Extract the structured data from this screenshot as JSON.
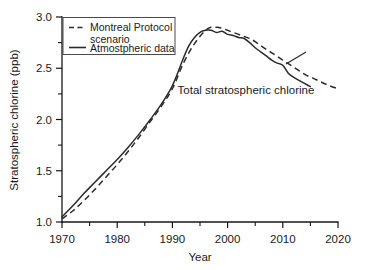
{
  "chart_data": {
    "type": "line",
    "title": "",
    "xlabel": "Year",
    "ylabel": "Stratospheric chlorine (ppb)",
    "xlim": [
      1970,
      2020
    ],
    "ylim": [
      1.0,
      3.0
    ],
    "xticks": [
      1970,
      1980,
      1990,
      2000,
      2010,
      2020
    ],
    "xtick_labels": [
      "1970",
      "1980",
      "1990",
      "2000",
      "2010",
      "2020"
    ],
    "yticks": [
      1.0,
      1.5,
      2.0,
      2.5,
      3.0
    ],
    "ytick_labels": [
      "1.0",
      "1.5",
      "2.0",
      "2.5",
      "3.0"
    ],
    "x_minor_ticks": [
      1975,
      1985,
      1995,
      2005,
      2015
    ],
    "y_minor_ticks": [
      1.25,
      1.75,
      2.25,
      2.75
    ],
    "grid": false,
    "legend_position": "top-left",
    "annotations": [
      {
        "text": "Total stratospheric chlorine",
        "x": 2000,
        "y": 2.38
      }
    ],
    "series": [
      {
        "name": "Montreal Protocol scenario",
        "style": "dashed",
        "color": "#2b2b2b",
        "x": [
          1970,
          1972,
          1974,
          1976,
          1978,
          1980,
          1982,
          1984,
          1986,
          1988,
          1990,
          1992,
          1994,
          1996,
          1997,
          1998,
          1999,
          2000,
          2001,
          2002,
          2003,
          2004,
          2005,
          2006,
          2008,
          2010,
          2012,
          2014,
          2016,
          2018,
          2020
        ],
        "values": [
          1.03,
          1.11,
          1.21,
          1.32,
          1.44,
          1.56,
          1.69,
          1.83,
          1.98,
          2.13,
          2.3,
          2.55,
          2.74,
          2.87,
          2.9,
          2.9,
          2.89,
          2.87,
          2.85,
          2.83,
          2.81,
          2.79,
          2.76,
          2.72,
          2.65,
          2.58,
          2.51,
          2.44,
          2.39,
          2.34,
          2.3
        ]
      },
      {
        "name": "Atmostpheric data",
        "style": "solid",
        "color": "#2b2b2b",
        "x": [
          1970,
          1972,
          1974,
          1976,
          1978,
          1980,
          1982,
          1984,
          1986,
          1988,
          1990,
          1992,
          1993,
          1994,
          1995,
          1996,
          1997,
          1998,
          1999,
          2000,
          2001,
          2002,
          2003,
          2004,
          2005,
          2006,
          2007,
          2008,
          2009,
          2010,
          2011,
          2012,
          2013,
          2014,
          2015
        ],
        "values": [
          1.05,
          1.16,
          1.28,
          1.39,
          1.5,
          1.61,
          1.73,
          1.86,
          2.0,
          2.15,
          2.33,
          2.6,
          2.72,
          2.8,
          2.85,
          2.87,
          2.87,
          2.85,
          2.86,
          2.83,
          2.82,
          2.8,
          2.79,
          2.75,
          2.7,
          2.66,
          2.62,
          2.58,
          2.55,
          2.53,
          2.45,
          2.41,
          2.38,
          2.35,
          2.32
        ]
      }
    ]
  },
  "legend": {
    "entries": [
      {
        "label_line1": "Montreal Protocol",
        "label_line2": "scenario",
        "style": "dashed"
      },
      {
        "label_line1": "Atmostpheric data",
        "label_line2": "",
        "style": "solid"
      }
    ]
  }
}
